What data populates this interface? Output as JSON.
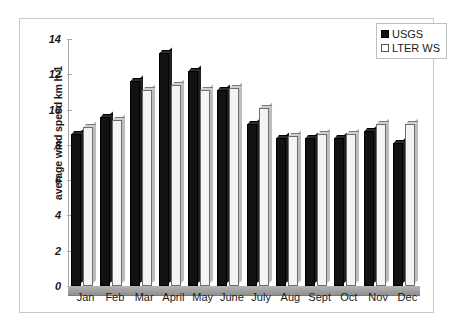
{
  "chart_data": {
    "type": "bar",
    "title": "",
    "xlabel": "",
    "ylabel": "average wind speed km h-1",
    "ylim": [
      0,
      14
    ],
    "yticks": [
      0,
      2,
      4,
      6,
      8,
      10,
      12,
      14
    ],
    "ytick_labels": [
      "0",
      "2",
      "4",
      "6",
      "8",
      "10",
      "12",
      "14"
    ],
    "grid": false,
    "legend_position": "top-right",
    "categories": [
      "Jan",
      "Feb",
      "Mar",
      "April",
      "May",
      "June",
      "July",
      "Aug",
      "Sept",
      "Oct",
      "Nov",
      "Dec"
    ],
    "series": [
      {
        "name": "USGS",
        "color": "#121212",
        "values": [
          8.6,
          9.6,
          11.6,
          13.2,
          12.2,
          11.1,
          9.2,
          8.4,
          8.4,
          8.4,
          8.8,
          8.1
        ]
      },
      {
        "name": "LTER WS",
        "color": "#ffffff",
        "values": [
          9.0,
          9.4,
          11.1,
          11.4,
          11.1,
          11.2,
          10.1,
          8.5,
          8.6,
          8.6,
          9.2,
          9.2
        ]
      }
    ]
  },
  "legend": {
    "entries": [
      {
        "label": "USGS",
        "swatch": "filled-square-black"
      },
      {
        "label": "LTER WS",
        "swatch": "hollow-square-white"
      }
    ]
  }
}
